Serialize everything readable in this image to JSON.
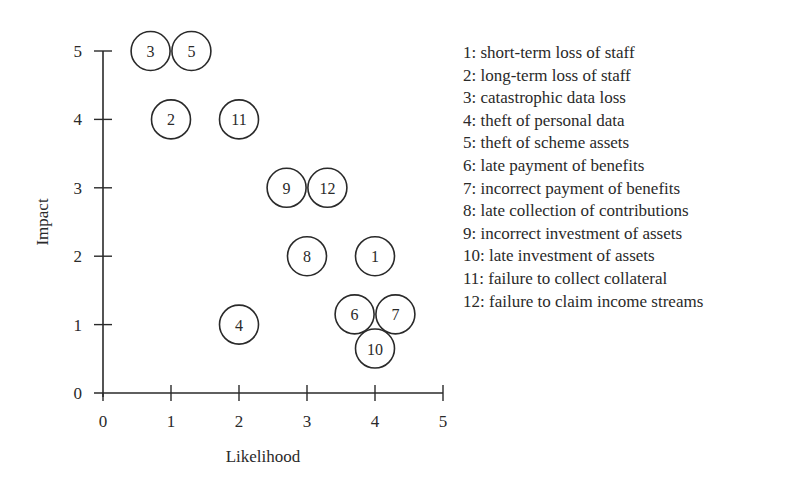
{
  "chart_data": {
    "type": "scatter",
    "title": "",
    "xlabel": "Likelihood",
    "ylabel": "Impact",
    "xlim": [
      0,
      5
    ],
    "ylim": [
      0,
      5
    ],
    "xticks": [
      0,
      1,
      2,
      3,
      4,
      5
    ],
    "yticks": [
      0,
      1,
      2,
      3,
      4,
      5
    ],
    "grid": false,
    "legend_position": "right",
    "points": [
      {
        "id": "1",
        "label": "short-term loss of staff",
        "x": 4,
        "y": 2
      },
      {
        "id": "2",
        "label": "long-term loss of staff",
        "x": 1,
        "y": 4
      },
      {
        "id": "3",
        "label": "catastrophic data loss",
        "x": 0.7,
        "y": 5
      },
      {
        "id": "4",
        "label": "theft of personal data",
        "x": 2,
        "y": 1
      },
      {
        "id": "5",
        "label": "theft of scheme assets",
        "x": 1.3,
        "y": 5
      },
      {
        "id": "6",
        "label": "late payment of benefits",
        "x": 3.7,
        "y": 1.15
      },
      {
        "id": "7",
        "label": "incorrect payment of benefits",
        "x": 4.3,
        "y": 1.15
      },
      {
        "id": "8",
        "label": "late collection of contributions",
        "x": 3,
        "y": 2
      },
      {
        "id": "9",
        "label": "incorrect investment of assets",
        "x": 2.7,
        "y": 3
      },
      {
        "id": "10",
        "label": "late investment of assets",
        "x": 4,
        "y": 0.65
      },
      {
        "id": "11",
        "label": "failure to collect collateral",
        "x": 2,
        "y": 4
      },
      {
        "id": "12",
        "label": "failure to claim income streams",
        "x": 3.3,
        "y": 3
      }
    ],
    "legend": [
      "1: short-term loss of staff",
      "2: long-term loss of staff",
      "3: catastrophic data loss",
      "4: theft of personal data",
      "5: theft of scheme assets",
      "6: late payment of benefits",
      "7: incorrect payment of benefits",
      "8: late collection of contributions",
      "9: incorrect investment of assets",
      "10: late investment of assets",
      "11: failure to collect collateral",
      "12: failure to claim income streams"
    ]
  },
  "axes": {
    "x_tick_labels": [
      "0",
      "1",
      "2",
      "3",
      "4",
      "5"
    ],
    "y_tick_labels": [
      "0",
      "1",
      "2",
      "3",
      "4",
      "5"
    ],
    "x_title": "Likelihood",
    "y_title": "Impact"
  },
  "style": {
    "ink": "#2a2a2a",
    "background": "#ffffff"
  }
}
